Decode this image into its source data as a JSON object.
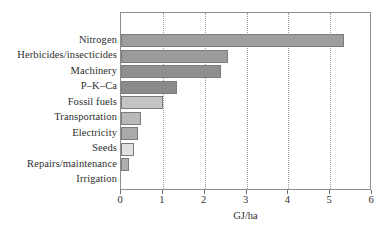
{
  "chart_data": {
    "type": "bar",
    "orientation": "horizontal",
    "title": "",
    "subtitle": "",
    "xlabel": "GJ/ha",
    "ylabel": "",
    "xlim": [
      0,
      6
    ],
    "ylim": null,
    "grid": true,
    "grid_axis": "x",
    "grid_style": "dotted",
    "legend": null,
    "legend_position": "none",
    "xticks": [
      "0",
      "1",
      "2",
      "3",
      "4",
      "5",
      "6"
    ],
    "xtick_values": [
      0,
      1,
      2,
      3,
      4,
      5,
      6
    ],
    "categories": [
      "Nitrogen",
      "Herbicides/insecticides",
      "Machinery",
      "P–K–Ca",
      "Fossil fuels",
      "Transportation",
      "Electricity",
      "Seeds",
      "Repairs/maintenance",
      "Irrigation"
    ],
    "values": [
      5.33,
      2.56,
      2.4,
      1.35,
      1.0,
      0.48,
      0.4,
      0.3,
      0.18,
      0.0
    ],
    "bar_colors": [
      "#9e9e9e",
      "#9b9b9b",
      "#8f8f8f",
      "#8a8a8a",
      "#c4c4c4",
      "#b9b9b9",
      "#aaaaaa",
      "#e0e0e0",
      "#b0b0b0",
      "#ffffff"
    ],
    "bar_edge_color": "#7c7c7c",
    "axis_color": "#8d8d8d",
    "grid_color": "#9a9a9a",
    "background_color": "#ffffff",
    "text_color": "#2e2e2e"
  }
}
